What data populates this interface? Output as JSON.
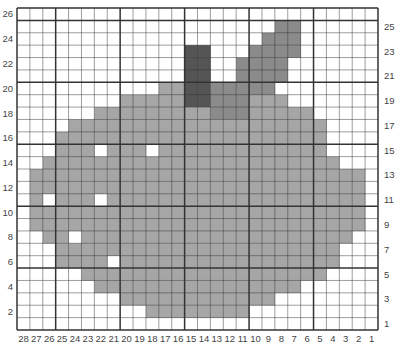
{
  "chart_data": {
    "type": "heatmap",
    "title": "",
    "columns": 28,
    "rows": 26,
    "x_tick_labels": [
      "28",
      "27",
      "26",
      "25",
      "24",
      "23",
      "22",
      "21",
      "20",
      "19",
      "18",
      "17",
      "16",
      "15",
      "14",
      "13",
      "12",
      "11",
      "10",
      "9",
      "8",
      "7",
      "6",
      "5",
      "4",
      "3",
      "2",
      "1"
    ],
    "left_row_labels": [
      "26",
      "24",
      "22",
      "20",
      "18",
      "16",
      "14",
      "12",
      "10",
      "8",
      "6",
      "4",
      "2"
    ],
    "right_row_labels": [
      "25",
      "23",
      "21",
      "19",
      "17",
      "15",
      "13",
      "11",
      "9",
      "7",
      "5",
      "3",
      "1"
    ],
    "major_gridline_every": 5,
    "colors": {
      "empty": "#ffffff",
      "L": "#a6a6a6",
      "M": "#8b8b8b",
      "D": "#555555",
      "grid": "#333333"
    },
    "legend": {
      "L": "apple body (light gray)",
      "M": "leaf (medium gray)",
      "D": "stem (dark gray)"
    },
    "grid_rows_top_to_bottom": [
      {
        "row": 26,
        "cells": "............................"
      },
      {
        "row": 25,
        "cells": "....................MM......"
      },
      {
        "row": 24,
        "cells": "...................MMM......"
      },
      {
        "row": 23,
        "cells": ".............DD...MMMM......"
      },
      {
        "row": 22,
        "cells": ".............DD..MMMM......."
      },
      {
        "row": 21,
        "cells": ".............DD..MMMM......."
      },
      {
        "row": 20,
        "cells": "...........LLDDMMMMM........"
      },
      {
        "row": 19,
        "cells": "........LLLLLDDMMMLLL......."
      },
      {
        "row": 18,
        "cells": "......LLLLLLLLLMMMLLLLL....."
      },
      {
        "row": 17,
        "cells": "....LLLLLLLLLLLLLLLLLLLL...."
      },
      {
        "row": 16,
        "cells": "...LLLLLLLLLLLLLLLLLLLLL...."
      },
      {
        "row": 15,
        "cells": "...LLL.LLL.LLLLLLLLLLLLL...."
      },
      {
        "row": 14,
        "cells": "..LLLLLLLLLLLLLLLLLLLLLLL..."
      },
      {
        "row": 13,
        "cells": ".LLLLLLLLLLLLLLLLLLLLLLLLLL."
      },
      {
        "row": 12,
        "cells": ".LLLLLLLLLLLLLLLLLLLLLLLLLL."
      },
      {
        "row": 11,
        "cells": ".L.LLL.LLLLLLLLLLLLLLLLLLLL."
      },
      {
        "row": 10,
        "cells": ".LLLLLLLLLLLLLLLLLLLLLLLLLL."
      },
      {
        "row": 9,
        "cells": ".LLLLLLLLLLLLLLLLLLLLLLLLLL."
      },
      {
        "row": 8,
        "cells": "..LL.LLLLLLLLLLLLLLLLLLLLL.."
      },
      {
        "row": 7,
        "cells": "...LLLLLLLLLLLLLLLLLLLLLL.."
      },
      {
        "row": 6,
        "cells": "...LLLL.LLLLLLLLLLLLLLLLL..."
      },
      {
        "row": 5,
        "cells": ".....LLLLLLLLLLLLLLLLLLL...."
      },
      {
        "row": 4,
        "cells": "......LLLLLLLLLLLLLLLL......"
      },
      {
        "row": 3,
        "cells": "........LLLLLLLLLLLL........"
      },
      {
        "row": 2,
        "cells": "..........LLLLLLLL.........."
      },
      {
        "row": 1,
        "cells": "............................"
      }
    ]
  }
}
